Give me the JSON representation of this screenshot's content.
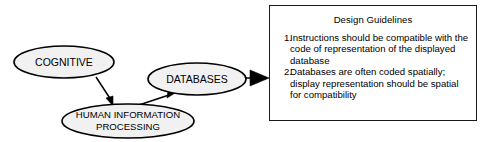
{
  "diagram": {
    "type": "flow-diagram",
    "background_color": "#ffffff",
    "stroke_color": "#000000",
    "node_fill_color": "#f1f1f1",
    "nodes": [
      {
        "id": "cognitive",
        "shape": "ellipse",
        "label": "COGNITIVE",
        "lines": [
          "COGNITIVE"
        ]
      },
      {
        "id": "human-information-processing",
        "shape": "ellipse",
        "label": "HUMAN INFORMATION PROCESSING",
        "lines": [
          "HUMAN INFORMATION",
          "PROCESSING"
        ]
      },
      {
        "id": "databases",
        "shape": "ellipse",
        "label": "DATABASES",
        "lines": [
          "DATABASES"
        ]
      }
    ],
    "edges": [
      {
        "id": "cognitive-to-hip",
        "from": "cognitive",
        "to": "human-information-processing"
      },
      {
        "id": "hip-to-databases",
        "from": "human-information-processing",
        "to": "databases"
      },
      {
        "id": "databases-to-guidelines",
        "from": "databases",
        "to": "design-guidelines"
      }
    ]
  },
  "guidelines": {
    "title": "Design Guidelines",
    "items": [
      {
        "number": "1.",
        "text": "Instructions should be compatible with the code of representation of the displayed database"
      },
      {
        "number": "2.",
        "text": "Databases are often coded spatially; display representation should be spatial for compatibility"
      }
    ]
  }
}
